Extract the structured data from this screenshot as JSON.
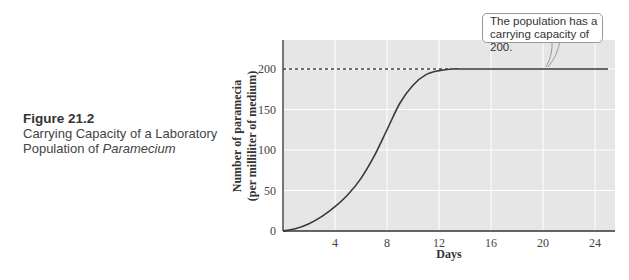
{
  "caption": {
    "figure_label": "Figure 21.2",
    "line1": "Carrying Capacity of a Laboratory",
    "line2_prefix": "Population of ",
    "line2_italic": "Paramecium"
  },
  "callout": {
    "line1": "The population has a",
    "line2": "carrying capacity of 200."
  },
  "colors": {
    "plot_background": "#e6e6e6",
    "gridline": "#ffffff",
    "curve": "#3a3a3a",
    "axis": "#333333"
  },
  "chart_data": {
    "type": "line",
    "title": "Carrying Capacity of a Laboratory Population of Paramecium",
    "xlabel": "Days",
    "ylabel": "Number of paramecia (per milliliter of medium)",
    "xlim": [
      0,
      25
    ],
    "ylim": [
      0,
      235
    ],
    "x_ticks": [
      4,
      8,
      12,
      16,
      20,
      24
    ],
    "y_ticks": [
      0,
      50,
      100,
      150,
      200
    ],
    "grid": true,
    "series": [
      {
        "name": "Paramecium population",
        "x": [
          0,
          1,
          2,
          3,
          4,
          5,
          6,
          7,
          8,
          9,
          10,
          11,
          12,
          13,
          14,
          16,
          20,
          24,
          25
        ],
        "values": [
          0,
          3,
          9,
          18,
          30,
          45,
          65,
          92,
          125,
          158,
          180,
          193,
          198,
          200,
          200,
          200,
          200,
          200,
          200
        ]
      }
    ],
    "annotations": [
      {
        "type": "dashed_line",
        "y": 200,
        "x_from": 0,
        "x_to": 13,
        "label": "carrying capacity"
      },
      {
        "type": "callout",
        "text": "The population has a carrying capacity of 200.",
        "x": 21,
        "y": 200
      }
    ]
  }
}
